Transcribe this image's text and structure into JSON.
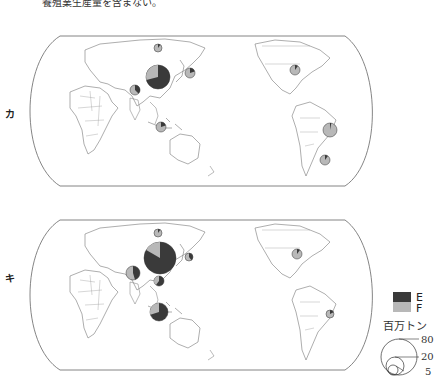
{
  "header": {
    "caption_top": "養殖業生産量を含まない。"
  },
  "footer": {
    "caption_bottom": ""
  },
  "colors": {
    "E": "#3a3a3a",
    "F": "#b8b8b8",
    "outline": "#666666",
    "land": "#ffffff",
    "border": "#888888"
  },
  "maps": [
    {
      "label": "カ",
      "pies": [
        {
          "region": "Russia",
          "total_mt": 4,
          "f_share": 0.15
        },
        {
          "region": "China",
          "total_mt": 40,
          "f_share": 0.32
        },
        {
          "region": "Japan",
          "total_mt": 6,
          "f_share": 0.85
        },
        {
          "region": "India",
          "total_mt": 7,
          "f_share": 0.6
        },
        {
          "region": "Indonesia",
          "total_mt": 6,
          "f_share": 0.85
        },
        {
          "region": "USA",
          "total_mt": 5,
          "f_share": 0.9
        },
        {
          "region": "Peru",
          "total_mt": 9,
          "f_share": 0.97
        },
        {
          "region": "Chile",
          "total_mt": 5,
          "f_share": 0.9
        }
      ]
    },
    {
      "label": "キ",
      "pies": [
        {
          "region": "Russia",
          "total_mt": 4,
          "f_share": 0.9
        },
        {
          "region": "China",
          "total_mt": 70,
          "f_share": 0.16
        },
        {
          "region": "Japan",
          "total_mt": 4,
          "f_share": 0.6
        },
        {
          "region": "India",
          "total_mt": 12,
          "f_share": 0.55
        },
        {
          "region": "Vietnam",
          "total_mt": 6,
          "f_share": 0.4
        },
        {
          "region": "Indonesia",
          "total_mt": 20,
          "f_share": 0.3
        },
        {
          "region": "USA",
          "total_mt": 5,
          "f_share": 0.9
        },
        {
          "region": "Peru",
          "total_mt": 4,
          "f_share": 0.85
        }
      ]
    }
  ],
  "legend": {
    "items": [
      {
        "key": "E",
        "label": "E"
      },
      {
        "key": "F",
        "label": "F"
      }
    ],
    "unit": "百万トン",
    "scale": [
      {
        "value": "80"
      },
      {
        "value": "20"
      },
      {
        "value": "5"
      }
    ]
  }
}
